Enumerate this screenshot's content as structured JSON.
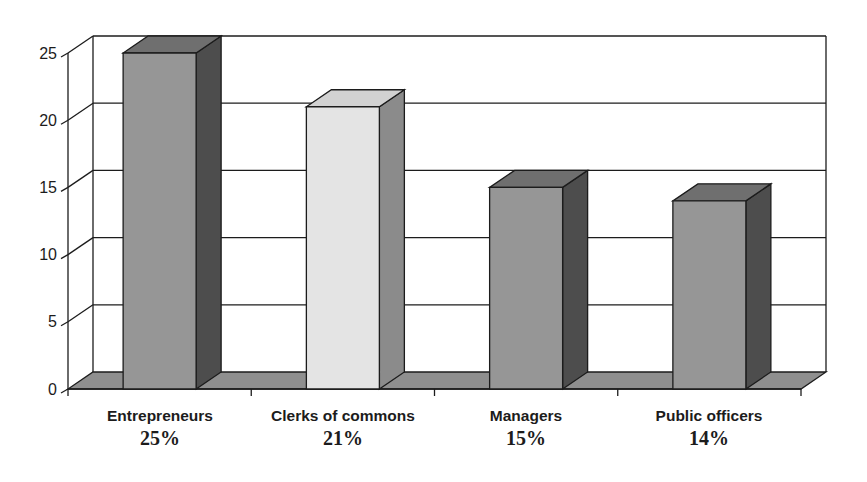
{
  "chart_data": {
    "type": "bar",
    "projection": "3d",
    "title": "",
    "xlabel": "",
    "ylabel": "",
    "categories": [
      {
        "name": "Entrepreneurs",
        "percent": "25%"
      },
      {
        "name": "Clerks of commons",
        "percent": "21%"
      },
      {
        "name": "Managers",
        "percent": "15%"
      },
      {
        "name": "Public officers",
        "percent": "14%"
      }
    ],
    "values": [
      25,
      21,
      15,
      14
    ],
    "yticks": [
      0,
      5,
      10,
      15,
      20,
      25
    ],
    "ylim": [
      0,
      25
    ],
    "grid": true,
    "legend": false,
    "colors": {
      "bar_default": {
        "front": "#969696",
        "top": "#6f6f6f",
        "side": "#4d4d4d"
      },
      "bar_highlight": {
        "front": "#e4e4e4",
        "top": "#d2d2d2",
        "side": "#8b8b8b"
      },
      "floor": "#8f8f8f",
      "line": "#1c1c1c",
      "background": "#ffffff"
    },
    "bar_styles": [
      "default",
      "highlight",
      "default",
      "default"
    ]
  }
}
